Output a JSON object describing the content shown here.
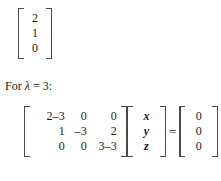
{
  "document": {
    "eigenvector_top": {
      "name": "eigenvector-column-vector",
      "entries": [
        "2",
        "1",
        "0"
      ]
    },
    "lead_text": {
      "prefix": "For ",
      "symbol": "λ",
      "relation": " = 3:"
    },
    "equation": {
      "coefficient_matrix": {
        "rows": [
          [
            "2–3",
            "0",
            "0"
          ],
          [
            "1",
            "–3",
            "2"
          ],
          [
            "0",
            "0",
            "3–3"
          ]
        ]
      },
      "variable_vector": {
        "entries": [
          "x",
          "y",
          "z"
        ]
      },
      "equals_sign": "=",
      "result_vector": {
        "entries": [
          "0",
          "0",
          "0"
        ]
      }
    }
  },
  "colors": {
    "background": "#ffffff",
    "ink": "#1a1a1a",
    "bracket": "#4a4a4a"
  }
}
